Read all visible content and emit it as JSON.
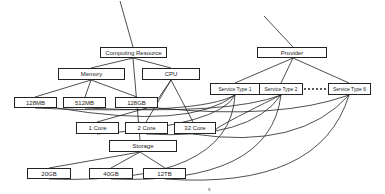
{
  "diagram": {
    "type": "tree-graph",
    "nodes": {
      "computing_resource": {
        "label": "Computing Resource",
        "x": 100,
        "y": 47,
        "w": 67,
        "h": 11
      },
      "memory": {
        "label": "Memory",
        "x": 58,
        "y": 68,
        "w": 67,
        "h": 12
      },
      "cpu": {
        "label": "CPU",
        "x": 142,
        "y": 68,
        "w": 58,
        "h": 12
      },
      "mem_128mb": {
        "label": "128MB",
        "x": 14,
        "y": 97,
        "w": 43,
        "h": 11
      },
      "mem_512mb": {
        "label": "512MB",
        "x": 63,
        "y": 97,
        "w": 43,
        "h": 11
      },
      "mem_128gb": {
        "label": "128GB",
        "x": 115,
        "y": 97,
        "w": 43,
        "h": 11
      },
      "cpu_1core": {
        "label": "1 Core",
        "x": 76,
        "y": 122,
        "w": 43,
        "h": 12
      },
      "cpu_2core": {
        "label": "2 Core",
        "x": 125,
        "y": 122,
        "w": 43,
        "h": 12
      },
      "cpu_32core": {
        "label": "32 Core",
        "x": 174,
        "y": 122,
        "w": 42,
        "h": 12
      },
      "storage": {
        "label": "Storage",
        "x": 109,
        "y": 140,
        "w": 68,
        "h": 12
      },
      "sto_20gb": {
        "label": "20GB",
        "x": 27,
        "y": 168,
        "w": 44,
        "h": 11
      },
      "sto_40gb": {
        "label": "40GB",
        "x": 89,
        "y": 168,
        "w": 44,
        "h": 11
      },
      "sto_12tb": {
        "label": "12TB",
        "x": 143,
        "y": 168,
        "w": 43,
        "h": 11
      },
      "provider": {
        "label": "Provider",
        "x": 257,
        "y": 47,
        "w": 70,
        "h": 11
      },
      "service_type_1": {
        "label": "Service Type 1",
        "x": 210,
        "y": 83,
        "w": 50,
        "h": 12
      },
      "service_type_2": {
        "label": "Service Type 2",
        "x": 259,
        "y": 83,
        "w": 44,
        "h": 12
      },
      "service_type_6": {
        "label": "Service Type 6",
        "x": 328,
        "y": 83,
        "w": 43,
        "h": 12
      }
    },
    "ellipsis_between": [
      "service_type_2",
      "service_type_6"
    ],
    "edges": [
      [
        "root_left",
        "computing_resource"
      ],
      [
        "computing_resource",
        "memory"
      ],
      [
        "computing_resource",
        "cpu"
      ],
      [
        "computing_resource",
        "storage"
      ],
      [
        "memory",
        "mem_128mb"
      ],
      [
        "memory",
        "mem_512mb"
      ],
      [
        "memory",
        "mem_128gb"
      ],
      [
        "cpu",
        "cpu_1core"
      ],
      [
        "cpu",
        "cpu_2core"
      ],
      [
        "cpu",
        "cpu_32core"
      ],
      [
        "storage",
        "sto_20gb"
      ],
      [
        "storage",
        "sto_40gb"
      ],
      [
        "storage",
        "sto_12tb"
      ],
      [
        "root_right",
        "provider"
      ],
      [
        "provider",
        "service_type_1"
      ],
      [
        "provider",
        "service_type_2"
      ],
      [
        "provider",
        "service_type_6"
      ]
    ],
    "curved_links_note": "Each service type connects via curved lines to memory, CPU core, and storage leaf nodes"
  }
}
